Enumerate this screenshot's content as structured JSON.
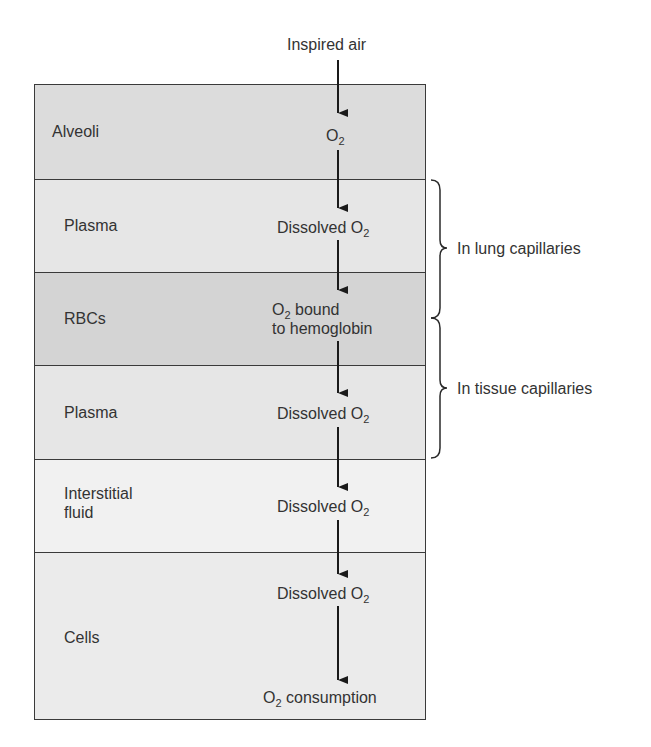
{
  "diagram": {
    "top_label": "Inspired air",
    "colors": {
      "alveoli": "#dcdcdc",
      "plasma": "#e6e6e6",
      "rbcs": "#d4d4d4",
      "interstitial": "#f1f1f1",
      "cells": "#ebebeb",
      "border": "#3a3a3a",
      "arrow": "#1a1a1a"
    },
    "compartments": [
      {
        "label": "Alveoli",
        "content": "O",
        "content_sub": "2",
        "content_suffix": ""
      },
      {
        "label": "Plasma",
        "content": "Dissolved O",
        "content_sub": "2",
        "content_suffix": ""
      },
      {
        "label": "RBCs",
        "content": "O",
        "content_sub": "2",
        "content_suffix": " bound",
        "content_line2": "to hemoglobin"
      },
      {
        "label": "Plasma",
        "content": "Dissolved O",
        "content_sub": "2",
        "content_suffix": ""
      },
      {
        "label_line1": "Interstitial",
        "label_line2": "fluid",
        "content": "Dissolved O",
        "content_sub": "2",
        "content_suffix": ""
      },
      {
        "label": "Cells",
        "content": "Dissolved O",
        "content_sub": "2",
        "content_suffix": "",
        "end_content": "O",
        "end_sub": "2",
        "end_suffix": " consumption"
      }
    ],
    "braces": [
      {
        "label": "In lung capillaries"
      },
      {
        "label": "In tissue capillaries"
      }
    ]
  }
}
